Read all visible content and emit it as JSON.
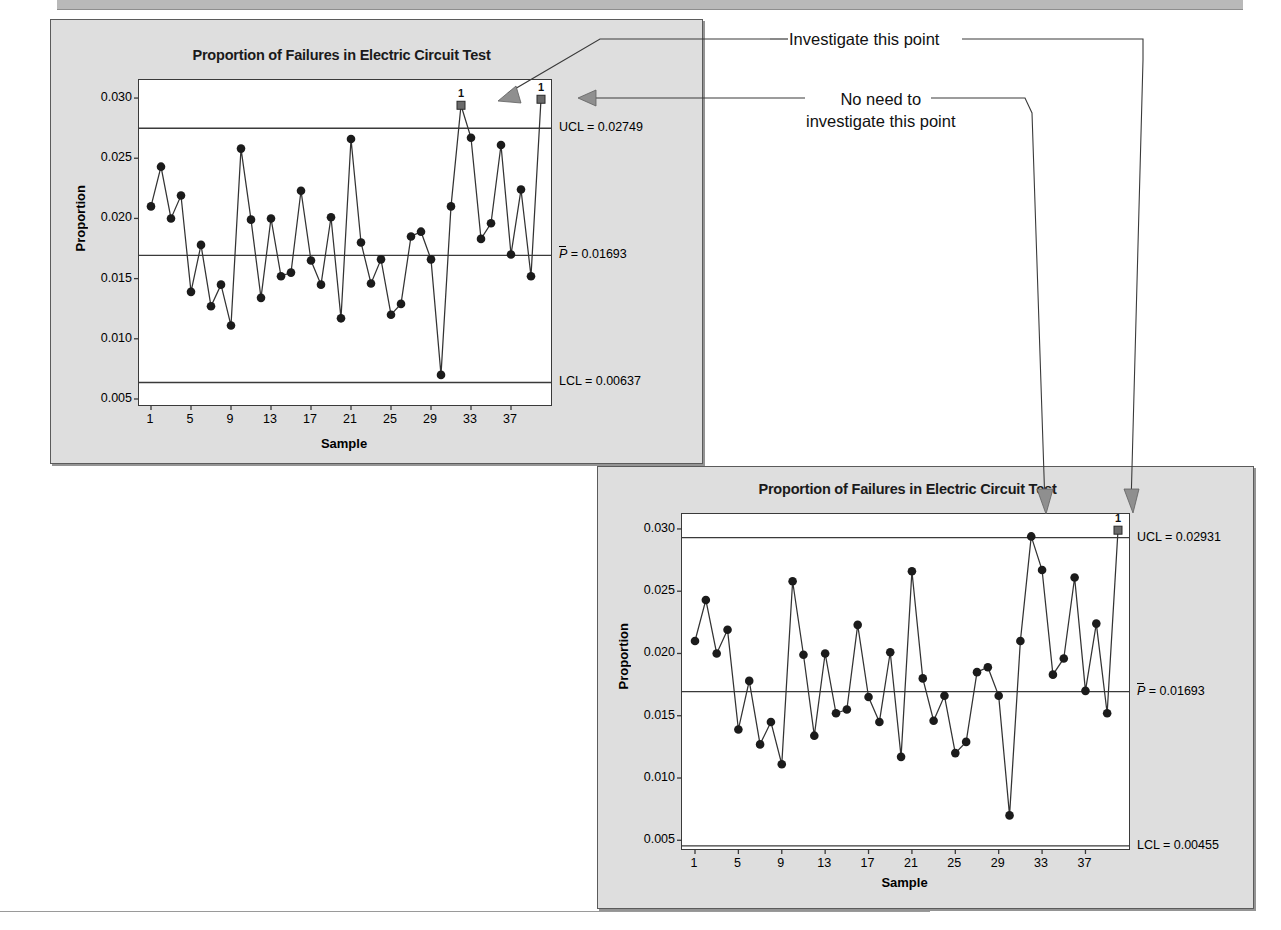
{
  "page": {
    "top_band": "",
    "annotations": [
      {
        "id": "investigate",
        "text": "Investigate this point"
      },
      {
        "id": "no-need-line1",
        "text": "No need to"
      },
      {
        "id": "no-need-line2",
        "text": "investigate this point"
      }
    ]
  },
  "charts": [
    {
      "id": "top",
      "title": "Proportion of Failures in Electric Circuit Test",
      "xlabel": "Sample",
      "ylabel": "Proportion",
      "ytick_labels": [
        "0.030",
        "0.025",
        "0.020",
        "0.015",
        "0.010",
        "0.005"
      ],
      "xtick_labels": [
        "1",
        "5",
        "9",
        "13",
        "17",
        "21",
        "25",
        "29",
        "33",
        "37"
      ],
      "ucl_label": "UCL = 0.02749",
      "center_label_prefix": "P",
      "center_label": " = 0.01693",
      "lcl_label": "LCL = 0.00455",
      "lcl_label_shown": "LCL = 0.00637",
      "violation_marker_label": "1"
    },
    {
      "id": "bottom",
      "title": "Proportion of Failures in Electric Circuit Test",
      "xlabel": "Sample",
      "ylabel": "Proportion",
      "ytick_labels": [
        "0.030",
        "0.025",
        "0.020",
        "0.015",
        "0.010",
        "0.005"
      ],
      "xtick_labels": [
        "1",
        "5",
        "9",
        "13",
        "17",
        "21",
        "25",
        "29",
        "33",
        "37"
      ],
      "ucl_label": "UCL = 0.02931",
      "center_label_prefix": "P",
      "center_label": " = 0.01693",
      "lcl_label_shown": "LCL = 0.00455",
      "violation_marker_label": "1"
    }
  ],
  "chart_data": [
    {
      "type": "line",
      "id": "p-chart-top",
      "title": "Proportion of Failures in Electric Circuit Test",
      "xlabel": "Sample",
      "ylabel": "Proportion",
      "ylim": [
        0.0045,
        0.0315
      ],
      "yticks": [
        0.03,
        0.025,
        0.02,
        0.015,
        0.01,
        0.005
      ],
      "xlim": [
        1,
        40
      ],
      "xticks": [
        1,
        5,
        9,
        13,
        17,
        21,
        25,
        29,
        33,
        37
      ],
      "grid": false,
      "legend": "none",
      "ucl": 0.02749,
      "center": 0.01693,
      "lcl": 0.00637,
      "x": [
        1,
        2,
        3,
        4,
        5,
        6,
        7,
        8,
        9,
        10,
        11,
        12,
        13,
        14,
        15,
        16,
        17,
        18,
        19,
        20,
        21,
        22,
        23,
        24,
        25,
        26,
        27,
        28,
        29,
        30,
        31,
        32,
        33,
        34,
        35,
        36,
        37,
        38,
        39,
        40
      ],
      "values": [
        0.021,
        0.0243,
        0.02,
        0.0219,
        0.0139,
        0.0178,
        0.0127,
        0.0145,
        0.0111,
        0.0258,
        0.0199,
        0.0134,
        0.02,
        0.0152,
        0.0155,
        0.0223,
        0.0165,
        0.0145,
        0.0201,
        0.0117,
        0.0266,
        0.018,
        0.0146,
        0.0166,
        0.012,
        0.0129,
        0.0185,
        0.0189,
        0.0166,
        0.007,
        0.021,
        0.0294,
        0.0267,
        0.0183,
        0.0196,
        0.0261,
        0.017,
        0.0224,
        0.0152,
        0.0299
      ],
      "out_of_control_points": [
        {
          "x": 32,
          "y": 0.0294,
          "label": "1"
        },
        {
          "x": 40,
          "y": 0.0299,
          "label": "1"
        }
      ]
    },
    {
      "type": "line",
      "id": "p-chart-bottom",
      "title": "Proportion of Failures in Electric Circuit Test",
      "xlabel": "Sample",
      "ylabel": "Proportion",
      "ylim": [
        0.0043,
        0.0312
      ],
      "yticks": [
        0.03,
        0.025,
        0.02,
        0.015,
        0.01,
        0.005
      ],
      "xlim": [
        1,
        40
      ],
      "xticks": [
        1,
        5,
        9,
        13,
        17,
        21,
        25,
        29,
        33,
        37
      ],
      "grid": false,
      "legend": "none",
      "ucl": 0.02931,
      "center": 0.01693,
      "lcl": 0.00455,
      "x": [
        1,
        2,
        3,
        4,
        5,
        6,
        7,
        8,
        9,
        10,
        11,
        12,
        13,
        14,
        15,
        16,
        17,
        18,
        19,
        20,
        21,
        22,
        23,
        24,
        25,
        26,
        27,
        28,
        29,
        30,
        31,
        32,
        33,
        34,
        35,
        36,
        37,
        38,
        39,
        40
      ],
      "values": [
        0.021,
        0.0243,
        0.02,
        0.0219,
        0.0139,
        0.0178,
        0.0127,
        0.0145,
        0.0111,
        0.0258,
        0.0199,
        0.0134,
        0.02,
        0.0152,
        0.0155,
        0.0223,
        0.0165,
        0.0145,
        0.0201,
        0.0117,
        0.0266,
        0.018,
        0.0146,
        0.0166,
        0.012,
        0.0129,
        0.0185,
        0.0189,
        0.0166,
        0.007,
        0.021,
        0.0294,
        0.0267,
        0.0183,
        0.0196,
        0.0261,
        0.017,
        0.0224,
        0.0152,
        0.0299
      ],
      "out_of_control_points": [
        {
          "x": 40,
          "y": 0.0299,
          "label": "1"
        }
      ]
    }
  ]
}
